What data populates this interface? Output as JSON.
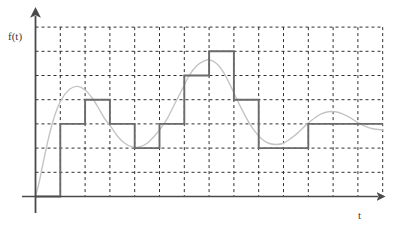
{
  "figure": {
    "title": "",
    "axis_labels": {
      "y": "f(t)",
      "x": "t"
    },
    "colors": {
      "axis": "#4a4a4a",
      "grid": "#2b2b2b",
      "step_curve": "#6b6b6b",
      "analog_curve": "#c0c0c0",
      "background": "#ffffff"
    }
  },
  "chart_data": {
    "type": "line",
    "title": "",
    "subtitle": "",
    "xlabel": "t",
    "ylabel": "f(t)",
    "grid": true,
    "grid_style": "dashed",
    "legend": "none",
    "axis_arrows": true,
    "xlim": [
      0,
      14
    ],
    "ylim": [
      0,
      7
    ],
    "x_gridlines": [
      1,
      2,
      3,
      4,
      5,
      6,
      7,
      8,
      9,
      10,
      11,
      12,
      13,
      14
    ],
    "y_gridlines": [
      1,
      2,
      3,
      4,
      5,
      6,
      7
    ],
    "series": [
      {
        "name": "analog signal",
        "type": "line",
        "style": "solid",
        "color": "#c0c0c0",
        "description": "damped oscillating continuous waveform",
        "x": [
          0.0,
          0.15,
          0.3,
          0.5,
          0.7,
          0.9,
          1.1,
          1.4,
          1.7,
          2.0,
          2.3,
          2.6,
          2.8,
          3.0,
          3.3,
          3.6,
          3.9,
          4.2,
          4.5,
          4.8,
          5.0,
          5.3,
          5.6,
          5.9,
          6.2,
          6.5,
          6.8,
          7.0,
          7.3,
          7.6,
          7.9,
          8.2,
          8.5,
          8.8,
          9.1,
          9.4,
          9.7,
          10.0,
          10.3,
          10.6,
          10.9,
          11.2,
          11.5,
          11.8,
          12.1,
          12.4,
          12.7,
          13.0,
          13.3,
          13.6,
          14.0
        ],
        "y": [
          0.0,
          0.6,
          1.35,
          2.3,
          3.1,
          3.7,
          4.1,
          4.45,
          4.55,
          4.4,
          4.05,
          3.55,
          3.2,
          2.95,
          2.5,
          2.2,
          2.05,
          2.05,
          2.2,
          2.5,
          2.75,
          3.2,
          3.8,
          4.4,
          5.0,
          5.4,
          5.6,
          5.65,
          5.5,
          5.1,
          4.5,
          3.85,
          3.25,
          2.75,
          2.4,
          2.2,
          2.15,
          2.2,
          2.4,
          2.65,
          2.95,
          3.2,
          3.4,
          3.5,
          3.5,
          3.4,
          3.25,
          3.05,
          2.9,
          2.8,
          2.75
        ]
      },
      {
        "name": "sampled / quantized step signal",
        "type": "step",
        "style": "solid",
        "color": "#6b6b6b",
        "description": "zero-order-hold staircase approximation of the analog signal",
        "step_interval": 1,
        "x_edges": [
          0,
          1,
          2,
          3,
          4,
          5,
          6,
          7,
          8,
          9,
          10,
          11,
          12,
          13,
          14
        ],
        "levels": [
          0,
          3,
          4,
          3,
          2,
          3,
          5,
          6,
          4,
          2,
          2,
          3,
          3,
          3
        ]
      }
    ]
  }
}
